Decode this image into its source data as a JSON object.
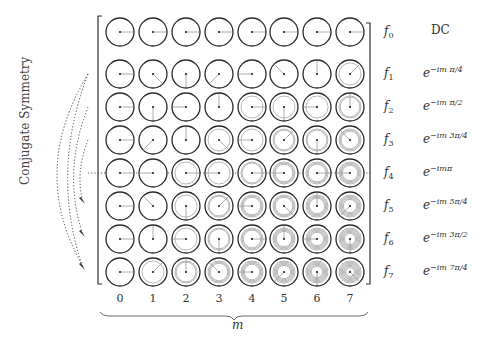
{
  "side_label": "Conjugate Symmetry",
  "m_axis_label": "m",
  "columns": [
    "0",
    "1",
    "2",
    "3",
    "4",
    "5",
    "6",
    "7"
  ],
  "rows": [
    {
      "f": "f",
      "sub": "0",
      "expr_base": "DC",
      "expr_sup": ""
    },
    {
      "f": "f",
      "sub": "1",
      "expr_base": "e",
      "expr_sup": "−im π/4"
    },
    {
      "f": "f",
      "sub": "2",
      "expr_base": "e",
      "expr_sup": "−im π/2"
    },
    {
      "f": "f",
      "sub": "3",
      "expr_base": "e",
      "expr_sup": "−im 3π/4"
    },
    {
      "f": "f",
      "sub": "4",
      "expr_base": "e",
      "expr_sup": "−imπ"
    },
    {
      "f": "f",
      "sub": "5",
      "expr_base": "e",
      "expr_sup": "−im 5π/4"
    },
    {
      "f": "f",
      "sub": "6",
      "expr_base": "e",
      "expr_sup": "−im 3π/2"
    },
    {
      "f": "f",
      "sub": "7",
      "expr_base": "e",
      "expr_sup": "−im 7π/4"
    }
  ],
  "colors": {
    "circle": "#2a2a2a",
    "spiral": "#8a8a8a",
    "arrow": "#999999",
    "dotted": "#333333"
  }
}
